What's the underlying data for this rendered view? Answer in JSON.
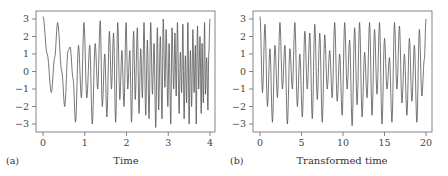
{
  "chart_data": [
    {
      "type": "line",
      "panel_label": "(a)",
      "title": "",
      "xlabel": "Time",
      "ylabel": "",
      "xlim": [
        0,
        4
      ],
      "ylim": [
        -3.3,
        3.3
      ],
      "xticks": [
        "0",
        "1",
        "2",
        "3",
        "4"
      ],
      "yticks": [
        "3",
        "2",
        "1",
        "0",
        "-1",
        "-2",
        "-3"
      ],
      "grid": false,
      "line_color": "#555555",
      "description": "Chirp-like oscillating signal between about -3 and 3 whose frequency increases with time",
      "series": [
        {
          "name": "signal",
          "x": [
            0.0,
            0.1,
            0.2,
            0.28,
            0.35,
            0.45,
            0.52,
            0.6,
            0.65,
            0.72,
            0.78,
            0.85,
            0.92,
            0.98,
            1.05,
            1.12,
            1.18,
            1.25,
            1.31,
            1.37,
            1.42,
            1.48,
            1.53,
            1.59,
            1.64,
            1.69,
            1.74,
            1.79,
            1.84,
            1.89,
            1.94,
            1.99,
            2.03,
            2.08,
            2.12,
            2.17,
            2.21,
            2.26,
            2.3,
            2.34,
            2.38,
            2.42,
            2.46,
            2.5,
            2.54,
            2.58,
            2.62,
            2.66,
            2.7,
            2.74,
            2.77,
            2.81,
            2.85,
            2.88,
            2.92,
            2.95,
            2.99,
            3.02,
            3.06,
            3.09,
            3.13,
            3.16,
            3.19,
            3.22,
            3.26,
            3.29,
            3.32,
            3.35,
            3.38,
            3.41,
            3.44,
            3.47,
            3.5,
            3.53,
            3.56,
            3.59,
            3.62,
            3.65,
            3.67,
            3.7,
            3.73,
            3.76,
            3.79,
            3.81,
            3.84,
            3.87,
            3.89,
            3.92,
            3.95,
            3.97,
            4.0
          ],
          "y": [
            3.14,
            1.0,
            -1.2,
            0.8,
            2.8,
            0.0,
            -2.0,
            1.2,
            1.4,
            -0.4,
            -2.9,
            1.5,
            -1.5,
            2.8,
            -1.5,
            1.5,
            -3.0,
            1.6,
            -1.0,
            2.9,
            -2.0,
            1.0,
            -2.6,
            2.3,
            -1.0,
            2.2,
            -2.9,
            2.8,
            -1.6,
            1.2,
            -2.0,
            2.8,
            -1.0,
            1.2,
            -2.9,
            2.3,
            -1.6,
            2.5,
            -2.4,
            1.3,
            -1.5,
            2.8,
            -2.5,
            1.8,
            -2.7,
            2.8,
            -1.3,
            1.6,
            -3.2,
            2.5,
            -2.2,
            2.0,
            -2.7,
            3.0,
            -0.9,
            2.4,
            -2.0,
            1.6,
            -3.0,
            2.5,
            -1.0,
            2.2,
            -1.4,
            2.8,
            -2.4,
            1.1,
            -1.2,
            2.7,
            -2.7,
            0.9,
            -1.8,
            2.8,
            -3.0,
            1.2,
            -2.0,
            2.4,
            -1.2,
            1.5,
            -3.0,
            2.6,
            -1.0,
            2.0,
            -2.4,
            1.6,
            -1.8,
            2.8,
            -1.3,
            0.8,
            -2.2,
            1.0,
            3.0
          ]
        }
      ]
    },
    {
      "type": "line",
      "panel_label": "(b)",
      "title": "",
      "xlabel": "Transformed time",
      "ylabel": "",
      "xlim": [
        0,
        20
      ],
      "ylim": [
        -3.3,
        3.3
      ],
      "xticks": [
        "0",
        "5",
        "10",
        "15",
        "20"
      ],
      "yticks": [
        "3",
        "2",
        "1",
        "0",
        "-1",
        "-2",
        "-3"
      ],
      "grid": false,
      "line_color": "#555555",
      "description": "Same signal plotted against transformed time, appearing as a regular oscillation between about -3 and 3",
      "series": [
        {
          "name": "signal",
          "x": [
            0.0,
            0.3,
            0.6,
            0.9,
            1.2,
            1.5,
            1.8,
            2.1,
            2.4,
            2.7,
            3.0,
            3.3,
            3.6,
            3.9,
            4.2,
            4.5,
            4.8,
            5.1,
            5.4,
            5.7,
            6.0,
            6.3,
            6.6,
            6.9,
            7.2,
            7.5,
            7.8,
            8.1,
            8.4,
            8.7,
            9.0,
            9.3,
            9.6,
            9.9,
            10.2,
            10.5,
            10.8,
            11.1,
            11.4,
            11.7,
            12.0,
            12.3,
            12.6,
            12.9,
            13.2,
            13.5,
            13.8,
            14.1,
            14.4,
            14.7,
            15.0,
            15.3,
            15.6,
            15.9,
            16.2,
            16.5,
            16.8,
            17.1,
            17.4,
            17.7,
            18.0,
            18.3,
            18.6,
            18.9,
            19.2,
            19.5,
            19.8,
            20.0
          ],
          "y": [
            3.14,
            -1.2,
            2.7,
            -2.0,
            1.3,
            -2.9,
            1.5,
            -1.5,
            2.8,
            -1.0,
            1.5,
            -3.0,
            1.3,
            -1.0,
            2.8,
            -2.0,
            1.0,
            -2.6,
            2.3,
            -1.0,
            2.2,
            -2.7,
            2.7,
            -1.6,
            2.2,
            -2.9,
            2.1,
            -1.0,
            1.2,
            -1.5,
            2.8,
            -1.7,
            1.0,
            -2.5,
            2.8,
            -1.0,
            1.8,
            -3.1,
            2.5,
            -1.9,
            2.8,
            -2.6,
            1.1,
            -1.5,
            2.8,
            -2.5,
            2.4,
            -1.3,
            2.8,
            -3.0,
            1.9,
            -1.0,
            0.8,
            -2.9,
            2.8,
            -1.0,
            2.6,
            -1.8,
            1.0,
            -2.5,
            1.9,
            -1.7,
            1.5,
            -2.9,
            2.4,
            -1.4,
            0.7,
            3.0
          ]
        }
      ]
    }
  ],
  "panels": [
    {
      "label": "(a)",
      "xlabel": "Time"
    },
    {
      "label": "(b)",
      "xlabel": "Transformed time"
    }
  ]
}
